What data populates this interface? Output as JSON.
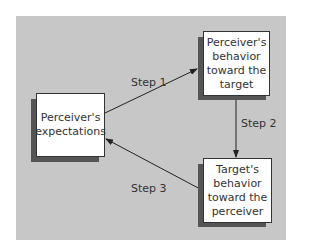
{
  "diagram": {
    "nodes": [
      {
        "id": "expectations",
        "label": "Perceiver's expectations"
      },
      {
        "id": "perceiver-behavior",
        "label": "Perceiver's behavior toward the target"
      },
      {
        "id": "target-behavior",
        "label": "Target's behavior toward the perceiver"
      }
    ],
    "edges": [
      {
        "from": "expectations",
        "to": "perceiver-behavior",
        "label": "Step 1"
      },
      {
        "from": "perceiver-behavior",
        "to": "target-behavior",
        "label": "Step 2"
      },
      {
        "from": "target-behavior",
        "to": "expectations",
        "label": "Step 3"
      }
    ],
    "colors": {
      "panel": "#c7c7c7",
      "box": "#ffffff",
      "shadow": "#555555",
      "line": "#333333"
    }
  }
}
